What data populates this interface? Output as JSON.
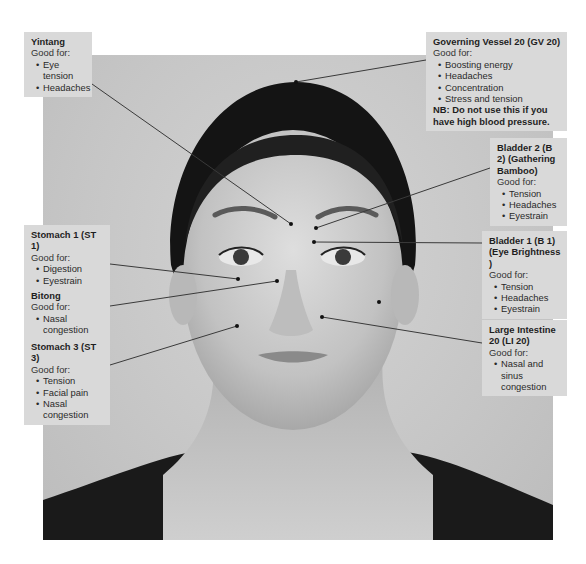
{
  "diagram": {
    "photo": {
      "x": 43,
      "y": 55,
      "width": 510,
      "height": 485
    },
    "line_color": "#3a3a3a",
    "box_color": "#d9d9d9",
    "points": [
      {
        "id": "yintang",
        "title": "Yintang",
        "good_for_label": "Good for:",
        "items": [
          "Eye tension",
          "Headaches"
        ],
        "box": {
          "x": 24,
          "y": 32,
          "w": 68,
          "h": 54
        },
        "line": {
          "x1": 92,
          "y1": 84,
          "x2": 291,
          "y2": 224
        },
        "dot": {
          "x": 291,
          "y": 224
        }
      },
      {
        "id": "gv20",
        "title": "Governing Vessel 20 (GV 20)",
        "good_for_label": "Good for:",
        "items": [
          "Boosting energy",
          "Headaches",
          "Concentration",
          "Stress and tension"
        ],
        "note": "NB: Do not use this if you have high blood pressure.",
        "box": {
          "x": 426,
          "y": 32,
          "w": 141,
          "h": 96
        },
        "line": {
          "x1": 426,
          "y1": 60,
          "x2": 296,
          "y2": 82
        },
        "dot": {
          "x": 296,
          "y": 82
        }
      },
      {
        "id": "b2",
        "title": "Bladder 2 (B 2) (Gathering Bamboo)",
        "good_for_label": "Good for:",
        "items": [
          "Tension",
          "Headaches",
          "Eyestrain"
        ],
        "box": {
          "x": 490,
          "y": 138,
          "w": 77,
          "h": 84
        },
        "line": {
          "x1": 490,
          "y1": 168,
          "x2": 316,
          "y2": 228
        },
        "dot": {
          "x": 316,
          "y": 228
        }
      },
      {
        "id": "b1",
        "title": "Bladder 1 (B 1) (Eye Brightness )",
        "good_for_label": "Good for:",
        "items": [
          "Tension",
          "Headaches",
          "Eyestrain"
        ],
        "box": {
          "x": 482,
          "y": 231,
          "w": 85,
          "h": 79
        },
        "line": {
          "x1": 482,
          "y1": 243,
          "x2": 314,
          "y2": 242
        },
        "dot": {
          "x": 314,
          "y": 242
        }
      },
      {
        "id": "li20",
        "title": "Large Intestine 20 (LI 20)",
        "good_for_label": "Good for:",
        "items": [
          "Nasal and sinus congestion"
        ],
        "box": {
          "x": 482,
          "y": 320,
          "w": 85,
          "h": 64
        },
        "line": {
          "x1": 482,
          "y1": 343,
          "x2": 322,
          "y2": 317
        },
        "dot": {
          "x": 322,
          "y": 317
        }
      },
      {
        "id": "st1",
        "title": "Stomach 1 (ST 1)",
        "good_for_label": "Good for:",
        "items": [
          "Digestion",
          "Eyestrain"
        ],
        "box": {
          "x": 24,
          "y": 225,
          "w": 86,
          "h": 52
        },
        "line": {
          "x1": 110,
          "y1": 264,
          "x2": 238,
          "y2": 279
        },
        "dot": {
          "x": 238,
          "y": 279
        }
      },
      {
        "id": "bitong",
        "title": "Bitong",
        "good_for_label": "Good for:",
        "items": [
          "Nasal congestion"
        ],
        "box": {
          "x": 24,
          "y": 286,
          "w": 86,
          "h": 42
        },
        "line": {
          "x1": 110,
          "y1": 306,
          "x2": 277,
          "y2": 281
        },
        "dot": {
          "x": 277,
          "y": 281
        }
      },
      {
        "id": "st3",
        "title": "Stomach 3 (ST 3)",
        "good_for_label": "Good for:",
        "items": [
          "Tension",
          "Facial pain",
          "Nasal congestion"
        ],
        "box": {
          "x": 24,
          "y": 337,
          "w": 86,
          "h": 64
        },
        "line": {
          "x1": 110,
          "y1": 365,
          "x2": 237,
          "y2": 326
        },
        "dot": {
          "x": 237,
          "y": 326
        }
      }
    ],
    "extra_dots": [
      {
        "x": 379,
        "y": 302
      }
    ]
  }
}
